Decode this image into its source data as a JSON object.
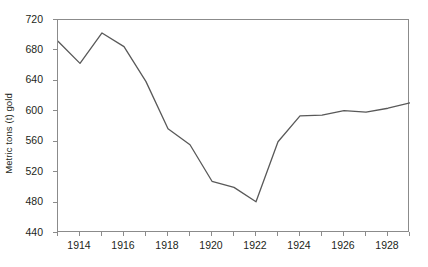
{
  "chart_data": {
    "type": "line",
    "title": "",
    "subtitle": "",
    "xlabel": "",
    "ylabel": "Metric tons (t) gold",
    "xlim": [
      1913,
      1929
    ],
    "ylim": [
      440,
      720
    ],
    "ytick_step": 40,
    "xtick_step": 2,
    "x_minor_tick_step": 1,
    "grid": false,
    "legend": null,
    "line_color": "#595959",
    "axis_color": "#8b8b8b",
    "text_color": "#231f20",
    "yticks": [
      440,
      480,
      520,
      560,
      600,
      640,
      680,
      720
    ],
    "xticks": [
      1914,
      1916,
      1918,
      1920,
      1922,
      1924,
      1926,
      1928
    ],
    "x": [
      1913,
      1914,
      1915,
      1916,
      1917,
      1918,
      1919,
      1920,
      1921,
      1922,
      1923,
      1924,
      1925,
      1926,
      1927,
      1928,
      1929
    ],
    "values": [
      692,
      663,
      703,
      685,
      639,
      577,
      556,
      508,
      500,
      481,
      560,
      594,
      595,
      601,
      599,
      604,
      611
    ],
    "series": [
      {
        "name": "Metric tons (t) gold",
        "values": [
          692,
          663,
          703,
          685,
          639,
          577,
          556,
          508,
          500,
          481,
          560,
          594,
          595,
          601,
          599,
          604,
          611
        ]
      }
    ]
  }
}
